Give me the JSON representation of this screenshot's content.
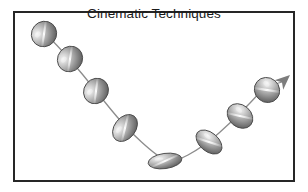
{
  "figure": {
    "title": "Cinematic Techniques",
    "background_color": "#ffffff",
    "frame": {
      "border_color": "#262626",
      "border_width_px": 2,
      "x": 13,
      "y": 11,
      "width": 282,
      "height": 171
    },
    "palette": {
      "ball_light": "#e8e8e8",
      "ball_mid": "#9a9a9a",
      "ball_dark": "#5e5e5e",
      "ball_outline": "#4a4a4a",
      "path_line": "#8c8c8c",
      "arrow_fill": "#7d7d7d",
      "title_color": "#1a1a1a"
    },
    "path": {
      "description": "V-shaped arc descending from upper-left to bottom-center then rising to upper-right",
      "stroke_color": "#8c8c8c",
      "stroke_width_px": 1.3,
      "points": [
        [
          32,
          22
        ],
        [
          57,
          48
        ],
        [
          83,
          80
        ],
        [
          112,
          116
        ],
        [
          145,
          146
        ],
        [
          160,
          152
        ],
        [
          190,
          136
        ],
        [
          222,
          108
        ],
        [
          252,
          76
        ]
      ]
    },
    "arrow": {
      "name": "direction-arrowhead",
      "tip_x": 277,
      "tip_y": 64,
      "angle_deg": -42,
      "fill": "#7d7d7d"
    },
    "balls": [
      {
        "index": 1,
        "label": "ball-1",
        "cx": 31,
        "cy": 23,
        "rx": 13.0,
        "ry": 12.4,
        "rotation_deg": -50,
        "shape": "sphere"
      },
      {
        "index": 2,
        "label": "ball-2",
        "cx": 57,
        "cy": 48,
        "rx": 13.2,
        "ry": 12.2,
        "rotation_deg": -50,
        "shape": "sphere"
      },
      {
        "index": 3,
        "label": "ball-3",
        "cx": 83,
        "cy": 80,
        "rx": 13.2,
        "ry": 12.0,
        "rotation_deg": -52,
        "shape": "sphere"
      },
      {
        "index": 4,
        "label": "ball-4",
        "cx": 112,
        "cy": 117,
        "rx": 15.0,
        "ry": 10.6,
        "rotation_deg": -52,
        "shape": "stretched-ellipse"
      },
      {
        "index": 5,
        "label": "ball-5",
        "cx": 152,
        "cy": 150,
        "rx": 17.0,
        "ry": 7.6,
        "rotation_deg": -8,
        "shape": "squashed-ellipse"
      },
      {
        "index": 6,
        "label": "ball-6",
        "cx": 196,
        "cy": 131,
        "rx": 15.0,
        "ry": 9.4,
        "rotation_deg": 40,
        "shape": "stretched-ellipse"
      },
      {
        "index": 7,
        "label": "ball-7",
        "cx": 227,
        "cy": 105,
        "rx": 14.0,
        "ry": 11.0,
        "rotation_deg": 40,
        "shape": "stretched-ellipse"
      },
      {
        "index": 8,
        "label": "ball-8",
        "cx": 254,
        "cy": 79,
        "rx": 13.0,
        "ry": 12.2,
        "rotation_deg": 40,
        "shape": "sphere"
      }
    ]
  }
}
